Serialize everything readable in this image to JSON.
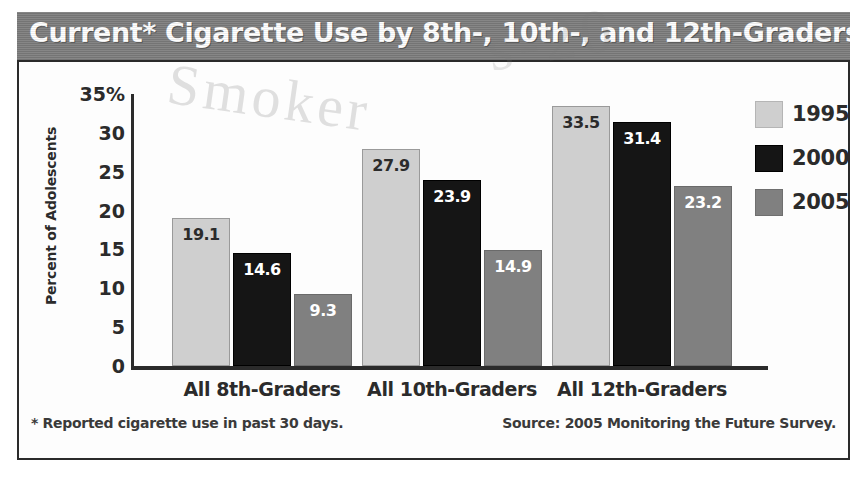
{
  "title": "Current* Cigarette Use by 8th-, 10th-, and 12th-Graders",
  "watermarks": {
    "left": "Smoker",
    "right": "s-20"
  },
  "footnote": "* Reported cigarette use in past 30 days.",
  "source": "Source: 2005 Monitoring the Future Survey.",
  "colors": {
    "title_bar": "#7d7d7d",
    "title_text": "#ffffff",
    "series_1995": "#cfcfcf",
    "series_2000": "#151515",
    "series_2005": "#808080",
    "axis": "#2b2b2b",
    "panel": "#fdfdfd"
  },
  "chart_data": {
    "type": "bar",
    "title": "Current* Cigarette Use by 8th-, 10th-, and 12th-Graders",
    "xlabel": "",
    "ylabel": "Percent of Adolescents",
    "ylim": [
      0,
      35
    ],
    "yticks": [
      "35%",
      "30",
      "25",
      "20",
      "15",
      "10",
      "5",
      "0"
    ],
    "ytick_values": [
      35,
      30,
      25,
      20,
      15,
      10,
      5,
      0
    ],
    "grid": false,
    "legend_position": "right",
    "categories": [
      "All 8th-Graders",
      "All 10th-Graders",
      "All 12th-Graders"
    ],
    "series": [
      {
        "name": "1995",
        "color": "#cfcfcf",
        "values": [
          19.1,
          27.9,
          33.5
        ],
        "labels": [
          "19.1",
          "27.9",
          "33.5"
        ]
      },
      {
        "name": "2000",
        "color": "#151515",
        "values": [
          14.6,
          23.9,
          31.4
        ],
        "labels": [
          "14.6",
          "23.9",
          "31.4"
        ]
      },
      {
        "name": "2005",
        "color": "#808080",
        "values": [
          9.3,
          14.9,
          23.2
        ],
        "labels": [
          "9.3",
          "14.9",
          "23.2"
        ]
      }
    ],
    "annotations": [
      "* Reported cigarette use in past 30 days.",
      "Source: 2005 Monitoring the Future Survey."
    ]
  }
}
